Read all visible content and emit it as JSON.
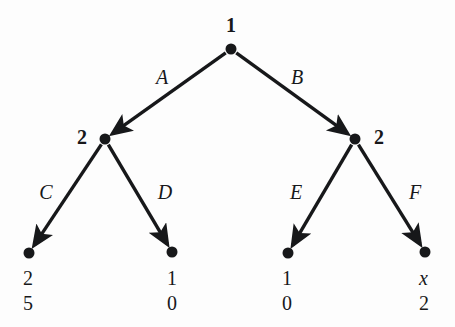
{
  "figure": {
    "type": "extensive-form-game-tree",
    "background_color": "#fdfdfd",
    "ink_color": "#17181a"
  },
  "chart_data": {
    "type": "diagram",
    "title": "",
    "xlabel": "",
    "ylabel": "",
    "nodes": [
      {
        "id": "root",
        "label": "1",
        "kind": "decision",
        "player": "1",
        "x": 231,
        "y": 49,
        "label_x": 231,
        "label_y": 25,
        "label_side": "above"
      },
      {
        "id": "n2L",
        "label": "2",
        "kind": "decision",
        "player": "2",
        "x": 105,
        "y": 139,
        "label_x": 82,
        "label_y": 137,
        "label_side": "left"
      },
      {
        "id": "n2R",
        "label": "2",
        "kind": "decision",
        "player": "2",
        "x": 355,
        "y": 139,
        "label_x": 379,
        "label_y": 137,
        "label_side": "right"
      },
      {
        "id": "t1",
        "label": "",
        "kind": "terminal",
        "player": "",
        "x": 29,
        "y": 253,
        "label_x": 0,
        "label_y": 0,
        "label_side": ""
      },
      {
        "id": "t2",
        "label": "",
        "kind": "terminal",
        "player": "",
        "x": 172,
        "y": 252,
        "label_x": 0,
        "label_y": 0,
        "label_side": ""
      },
      {
        "id": "t3",
        "label": "",
        "kind": "terminal",
        "player": "",
        "x": 288,
        "y": 253,
        "label_x": 0,
        "label_y": 0,
        "label_side": ""
      },
      {
        "id": "t4",
        "label": "",
        "kind": "terminal",
        "player": "",
        "x": 425,
        "y": 252,
        "label_x": 0,
        "label_y": 0,
        "label_side": ""
      }
    ],
    "edges": [
      {
        "id": "edgeA",
        "label": "A",
        "from": "root",
        "to": "n2L",
        "x1": 231,
        "y1": 49,
        "x2": 105,
        "y2": 139,
        "label_x": 162,
        "label_y": 77
      },
      {
        "id": "edgeB",
        "label": "B",
        "from": "root",
        "to": "n2R",
        "x1": 231,
        "y1": 49,
        "x2": 355,
        "y2": 139,
        "label_x": 297,
        "label_y": 77
      },
      {
        "id": "edgeC",
        "label": "C",
        "from": "n2L",
        "to": "t1",
        "x1": 105,
        "y1": 139,
        "x2": 29,
        "y2": 253,
        "label_x": 46,
        "label_y": 192
      },
      {
        "id": "edgeD",
        "label": "D",
        "from": "n2L",
        "to": "t2",
        "x1": 105,
        "y1": 139,
        "x2": 172,
        "y2": 252,
        "label_x": 165,
        "label_y": 192
      },
      {
        "id": "edgeE",
        "label": "E",
        "from": "n2R",
        "to": "t3",
        "x1": 355,
        "y1": 139,
        "x2": 288,
        "y2": 253,
        "label_x": 296,
        "label_y": 192
      },
      {
        "id": "edgeF",
        "label": "F",
        "from": "n2R",
        "to": "t4",
        "x1": 355,
        "y1": 139,
        "x2": 425,
        "y2": 252,
        "label_x": 415,
        "label_y": 192
      }
    ],
    "payoffs": [
      {
        "node": "t1",
        "player1": "2",
        "player2": "5",
        "player1_italic": false,
        "player2_italic": false,
        "x": 23,
        "y1": 268,
        "y2": 293
      },
      {
        "node": "t2",
        "player1": "1",
        "player2": "0",
        "player1_italic": false,
        "player2_italic": false,
        "x": 167,
        "y1": 268,
        "y2": 293
      },
      {
        "node": "t3",
        "player1": "1",
        "player2": "0",
        "player1_italic": false,
        "player2_italic": false,
        "x": 282,
        "y1": 268,
        "y2": 293
      },
      {
        "node": "t4",
        "player1": "x",
        "player2": "2",
        "player1_italic": true,
        "player2_italic": false,
        "x": 419,
        "y1": 268,
        "y2": 293
      }
    ],
    "legend": [],
    "annotations": []
  }
}
